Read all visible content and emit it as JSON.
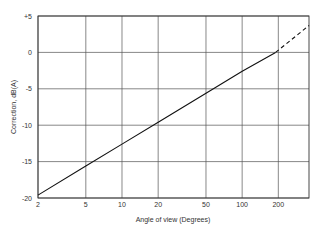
{
  "chart_data": {
    "type": "line",
    "title": "",
    "xlabel": "Angle of view (Degrees)",
    "ylabel": "Correction, dB(A)",
    "xscale": "log",
    "xlim": [
      2,
      360
    ],
    "ylim": [
      -20,
      5
    ],
    "x_ticks": [
      "2",
      "5",
      "10",
      "20",
      "50",
      "100",
      "200"
    ],
    "y_ticks": [
      "+5",
      "0",
      "-5",
      "-10",
      "-15",
      "-20"
    ],
    "grid": true,
    "series": [
      {
        "name": "Correction (solid)",
        "style": "solid",
        "x": [
          2,
          5,
          10,
          20,
          50,
          100,
          190
        ],
        "y": [
          -19.6,
          -15.6,
          -12.6,
          -9.6,
          -5.6,
          -2.6,
          0
        ]
      },
      {
        "name": "Correction (extrapolated)",
        "style": "dashed",
        "x": [
          190,
          360
        ],
        "y": [
          0,
          3.7
        ]
      }
    ]
  }
}
